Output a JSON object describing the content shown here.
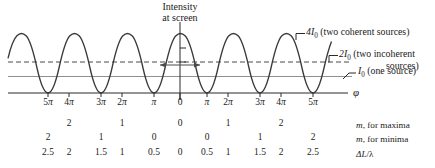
{
  "figure": {
    "title_note": "Intensity at screen",
    "screen_label_line1": "Intensity",
    "screen_label_line2": "at screen",
    "axis_variable": "φ"
  },
  "callouts": {
    "coherent": {
      "level": "4I",
      "level_sub": "0",
      "text": "(two coherent sources)"
    },
    "incoherent": {
      "level": "2I",
      "level_sub": "0",
      "text": "(two incoherent",
      "text_line2": "sources)"
    },
    "single": {
      "level": "I",
      "level_sub": "0",
      "text": "(one source)"
    }
  },
  "axis": {
    "ticks": [
      {
        "label": "5π",
        "phi": -5
      },
      {
        "label": "4π",
        "phi": -4
      },
      {
        "label": "3π",
        "phi": -3
      },
      {
        "label": "2π",
        "phi": -2
      },
      {
        "label": "π",
        "phi": -1
      },
      {
        "label": "0",
        "phi": 0
      },
      {
        "label": "π",
        "phi": 1
      },
      {
        "label": "2π",
        "phi": 2
      },
      {
        "label": "3π",
        "phi": 3
      },
      {
        "label": "4π",
        "phi": 4
      },
      {
        "label": "5π",
        "phi": 5
      }
    ]
  },
  "rows": [
    {
      "caption_prefix": "m",
      "caption_rest": ", for maxima",
      "values": [
        "",
        "2",
        "",
        "1",
        "",
        "0",
        "",
        "1",
        "",
        "2",
        ""
      ]
    },
    {
      "caption_prefix": "m",
      "caption_rest": ", for minima",
      "values": [
        "2",
        "",
        "1",
        "",
        "0",
        "",
        "0",
        "",
        "1",
        "",
        "2"
      ]
    },
    {
      "caption_prefix": "ΔL",
      "caption_rest": "/λ",
      "values": [
        "2.5",
        "2",
        "1.5",
        "1",
        "0.5",
        "0",
        "0.5",
        "1",
        "1.5",
        "2",
        "2.5"
      ]
    }
  ],
  "chart_data": {
    "type": "line",
    "title": "Intensity at screen",
    "xlabel": "φ",
    "ylabel": "Intensity",
    "x_unit": "π radians",
    "xlim": [
      -5.6,
      5.6
    ],
    "ylim": [
      0,
      4
    ],
    "grid": false,
    "legend_position": "right",
    "curve": {
      "name": "Two coherent sources",
      "formula": "I = 4 I0 cos^2(phi/2)",
      "peak_value": 4,
      "min_value": 0,
      "peaks_at_phi": [
        -4,
        -2,
        0,
        2,
        4
      ],
      "minima_at_phi": [
        -5,
        -3,
        -1,
        1,
        3,
        5
      ],
      "color": "#3a3a3a"
    },
    "reference_lines": [
      {
        "name": "2I0 (two incoherent sources)",
        "value": 2,
        "style": "dashed",
        "color": "#4a4a4a"
      },
      {
        "name": "I0 (one source)",
        "value": 1,
        "style": "solid",
        "color": "#8a8a8a"
      },
      {
        "name": "baseline",
        "value": 0,
        "style": "solid",
        "color": "#3a3a3a"
      }
    ],
    "annotations": [
      {
        "text": "Intensity at screen",
        "phi": 0,
        "value": 4
      },
      {
        "text": "4I0 (two coherent sources)",
        "phi": 4,
        "value": 4
      },
      {
        "text": "2I0 (two incoherent sources)",
        "phi": 5,
        "value": 2
      },
      {
        "text": "I0 (one source)",
        "phi": 5.2,
        "value": 1
      }
    ],
    "tables": [
      {
        "label": "m, for maxima",
        "values": [
          "",
          "2",
          "",
          "1",
          "",
          "0",
          "",
          "1",
          "",
          "2",
          ""
        ]
      },
      {
        "label": "m, for minima",
        "values": [
          "2",
          "",
          "1",
          "",
          "0",
          "",
          "0",
          "",
          "1",
          "",
          "2"
        ]
      },
      {
        "label": "ΔL/λ",
        "values": [
          "2.5",
          "2",
          "1.5",
          "1",
          "0.5",
          "0",
          "0.5",
          "1",
          "1.5",
          "2",
          "2.5"
        ]
      }
    ]
  }
}
